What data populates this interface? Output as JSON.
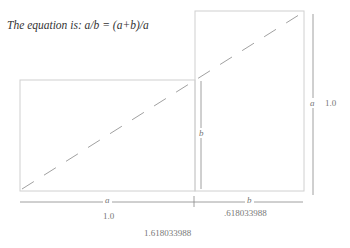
{
  "title": "The equation is: a/b = (a+b)/a",
  "labels": {
    "a_bottom": "a",
    "b_bottom": "b",
    "b_inner": "b",
    "a_right": "a",
    "a_value": "1.0",
    "b_value": ".618033988",
    "right_value": "1.0",
    "total_value": "1.618033988"
  },
  "colors": {
    "line": "#c8c8c8",
    "dark": "#888888"
  }
}
